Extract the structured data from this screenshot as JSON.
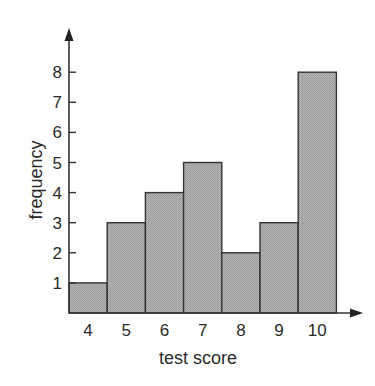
{
  "chart_data": {
    "type": "bar",
    "subtype": "histogram",
    "title": "",
    "xlabel": "test score",
    "ylabel": "frequency",
    "categories": [
      "4",
      "5",
      "6",
      "7",
      "8",
      "9",
      "10"
    ],
    "values": [
      1,
      3,
      4,
      5,
      2,
      3,
      8
    ],
    "y_ticks": [
      "1",
      "2",
      "3",
      "4",
      "5",
      "6",
      "7",
      "8"
    ],
    "ylim": [
      0,
      8.8
    ],
    "grid": false,
    "legend": null,
    "bar_fill": "#ababab",
    "bar_stroke": "#333333",
    "axis_color": "#333333",
    "axes_with_arrows": true
  }
}
